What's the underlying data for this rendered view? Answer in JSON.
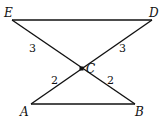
{
  "diagram": {
    "points": {
      "E": {
        "label": "E"
      },
      "D": {
        "label": "D"
      },
      "C": {
        "label": "C"
      },
      "A": {
        "label": "A"
      },
      "B": {
        "label": "B"
      }
    },
    "segment_labels": {
      "EC": "3",
      "DC": "3",
      "AC": "2",
      "BC": "2"
    }
  }
}
